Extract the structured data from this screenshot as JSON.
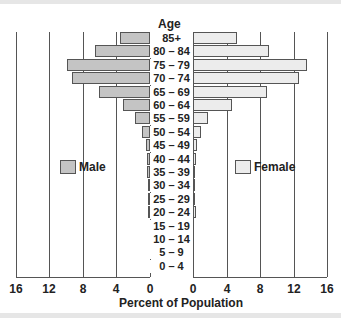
{
  "chart_data": {
    "type": "bar",
    "orientation": "horizontal",
    "subtype": "population-pyramid",
    "title": "",
    "ylabel": "Age",
    "xlabel": "Percent of Population",
    "categories": [
      "85+",
      "80 – 84",
      "75 – 79",
      "70 – 74",
      "65 – 69",
      "60 – 64",
      "55 – 59",
      "50 – 54",
      "45 – 49",
      "40 – 44",
      "35 – 39",
      "30 – 34",
      "25 – 29",
      "20 – 24",
      "15 – 19",
      "10 – 14",
      "5 – 9",
      "0 – 4"
    ],
    "series": [
      {
        "name": "Male",
        "color": "#c4c4c4",
        "values": [
          3.6,
          6.5,
          9.9,
          9.3,
          6.1,
          3.2,
          1.8,
          0.9,
          0.5,
          0.4,
          0.3,
          0.2,
          0.2,
          0.2,
          0,
          0,
          0,
          0
        ]
      },
      {
        "name": "Female",
        "color": "#ececec",
        "values": [
          5.2,
          9.0,
          13.6,
          12.6,
          8.8,
          4.6,
          1.8,
          0.9,
          0.5,
          0.3,
          0.2,
          0.2,
          0.2,
          0.3,
          0,
          0,
          0,
          0
        ]
      }
    ],
    "xlim": [
      0,
      16
    ],
    "x_ticks_left": [
      "16",
      "12",
      "8",
      "4",
      "0"
    ],
    "x_ticks_right": [
      "0",
      "4",
      "8",
      "12",
      "16"
    ],
    "grid": true,
    "legend": [
      "Male",
      "Female"
    ]
  },
  "labels": {
    "age_title": "Age",
    "x_title": "Percent of Population",
    "legend_male": "Male",
    "legend_female": "Female"
  }
}
